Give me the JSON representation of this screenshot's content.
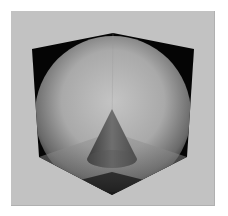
{
  "image": {
    "description": "3D rendered scene: inside corner of a cube containing a translucent shaded hemisphere/sphere and a cone standing on the floor plane",
    "colors": {
      "background": "#ffffff",
      "panel": "#c2c2c2",
      "cube_walls": "#050505",
      "sphere_light": "#bdbdbd",
      "sphere_dark": "#3a3a3a",
      "floor": "#8a8a8a",
      "cone_light": "#6e6e6e",
      "cone_dark": "#2e2e2e"
    },
    "objects": [
      {
        "name": "cube-corner",
        "vertices": {
          "top": [
            113,
            33
          ],
          "left_top": [
            32,
            49
          ],
          "right_top": [
            194,
            49
          ],
          "left_bottom": [
            39,
            157
          ],
          "right_bottom": [
            187,
            157
          ],
          "bottom": [
            112,
            195
          ],
          "inner": [
            112,
            132
          ]
        }
      },
      {
        "name": "sphere",
        "center": [
          113,
          112
        ],
        "radius": 76
      },
      {
        "name": "cone",
        "apex": [
          112,
          109
        ],
        "base_center": [
          112,
          159
        ],
        "base_rx": 25,
        "base_ry": 9
      }
    ]
  }
}
